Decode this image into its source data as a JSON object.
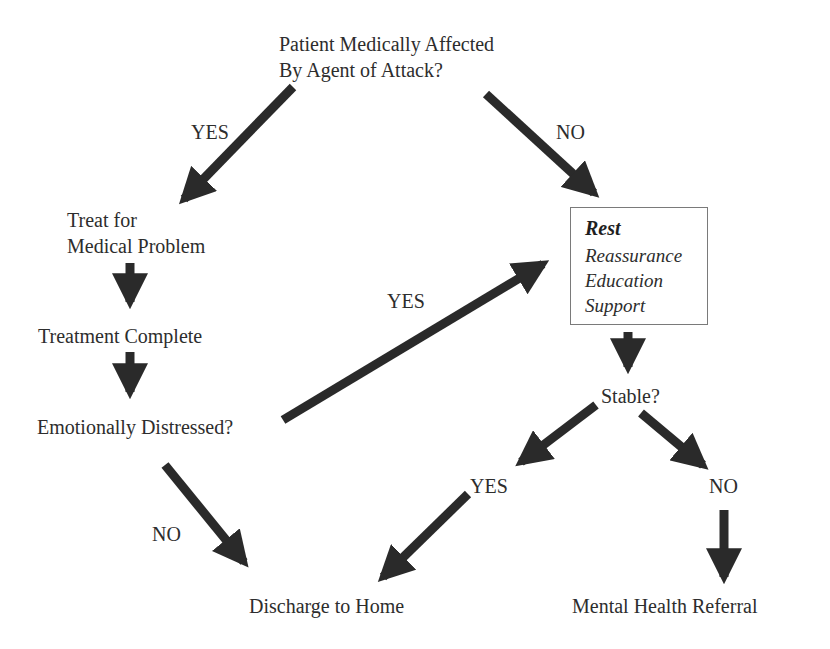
{
  "diagram": {
    "type": "flowchart",
    "colors": {
      "arrow": "#2a2a2a",
      "text": "#2d2d2d",
      "box_border": "#7a7a7a",
      "background": "#ffffff"
    },
    "nodes": {
      "start": {
        "line1": "Patient Medically Affected",
        "line2": "By Agent of Attack?"
      },
      "treat": {
        "line1": "Treat for",
        "line2": "Medical Problem"
      },
      "treatment_complete": {
        "label": "Treatment Complete"
      },
      "emotionally_distressed": {
        "label": "Emotionally Distressed?"
      },
      "care_box": {
        "title": "Rest",
        "items": [
          "Reassurance",
          "Education",
          "Support"
        ]
      },
      "stable": {
        "label": "Stable?"
      },
      "stable_yes": {
        "label": "YES"
      },
      "stable_no": {
        "label": "NO"
      },
      "discharge": {
        "label": "Discharge to Home"
      },
      "referral": {
        "label": "Mental Health Referral"
      }
    },
    "edge_labels": {
      "start_yes": "YES",
      "start_no": "NO",
      "distressed_yes": "YES",
      "distressed_no": "NO"
    },
    "edges": [
      {
        "from": "start",
        "to": "treat",
        "label": "YES"
      },
      {
        "from": "start",
        "to": "care_box",
        "label": "NO"
      },
      {
        "from": "treat",
        "to": "treatment_complete",
        "label": ""
      },
      {
        "from": "treatment_complete",
        "to": "emotionally_distressed",
        "label": ""
      },
      {
        "from": "emotionally_distressed",
        "to": "care_box",
        "label": "YES"
      },
      {
        "from": "emotionally_distressed",
        "to": "discharge",
        "label": "NO"
      },
      {
        "from": "care_box",
        "to": "stable",
        "label": ""
      },
      {
        "from": "stable",
        "to": "stable_yes",
        "label": ""
      },
      {
        "from": "stable",
        "to": "stable_no",
        "label": ""
      },
      {
        "from": "stable_yes",
        "to": "discharge",
        "label": ""
      },
      {
        "from": "stable_no",
        "to": "referral",
        "label": ""
      }
    ]
  }
}
